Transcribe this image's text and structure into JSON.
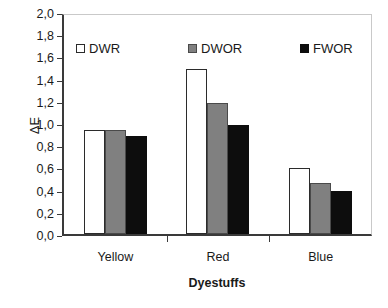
{
  "chart_data": {
    "type": "bar",
    "title": "",
    "subtitle": "",
    "xlabel": "Dyestuffs",
    "ylabel": "ΔE",
    "categories": [
      "Yellow",
      "Red",
      "Blue"
    ],
    "series": [
      {
        "name": "DWR",
        "values": [
          0.95,
          1.5,
          0.6
        ],
        "color": "#ffffff",
        "edge_color": "#2b2b2b"
      },
      {
        "name": "DWOR",
        "values": [
          0.95,
          1.19,
          0.46
        ],
        "color": "#808080",
        "edge_color": "#4a4a4a"
      },
      {
        "name": "FWOR",
        "values": [
          0.89,
          0.99,
          0.39
        ],
        "color": "#0d0d0d",
        "edge_color": "#0d0d0d"
      }
    ],
    "ylim": [
      0.0,
      2.0
    ],
    "ytick_step": 0.2,
    "ytick_labels": [
      "0,0",
      "0,2",
      "0,4",
      "0,6",
      "0,8",
      "1,0",
      "1,2",
      "1,4",
      "1,6",
      "1,8",
      "2,0"
    ],
    "ytick_values": [
      0.0,
      0.2,
      0.4,
      0.6,
      0.8,
      1.0,
      1.2,
      1.4,
      1.6,
      1.8,
      2.0
    ],
    "decimal_separator": ",",
    "grid": false,
    "legend_position": "top-inside",
    "frame": {
      "axis_color": "#3a3a3a",
      "top_right_border_color": "#c9c9c9",
      "background": "#ffffff"
    }
  }
}
